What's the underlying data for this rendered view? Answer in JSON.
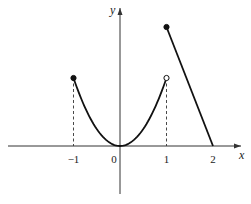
{
  "chart_data": {
    "type": "line",
    "title": "",
    "xlabel": "x",
    "ylabel": "y",
    "xlim": [
      -2.6,
      2.3
    ],
    "ylim": [
      -0.75,
      2.05
    ],
    "x_ticks": [
      {
        "value": -1,
        "label": "−1"
      },
      {
        "value": 0,
        "label": "0"
      },
      {
        "value": 1,
        "label": "1"
      },
      {
        "value": 2,
        "label": "2"
      }
    ],
    "grid": false,
    "series": [
      {
        "name": "parabola",
        "description": "y = x^2 on [-1, 1)",
        "x": [
          -1,
          -0.75,
          -0.5,
          -0.25,
          0,
          0.25,
          0.5,
          0.75,
          1
        ],
        "y": [
          1,
          0.5625,
          0.25,
          0.0625,
          0,
          0.0625,
          0.25,
          0.5625,
          1
        ]
      },
      {
        "name": "line",
        "description": "decreasing segment on [1, 2]",
        "x": [
          1,
          2
        ],
        "y": [
          1.75,
          0
        ]
      }
    ],
    "points": [
      {
        "x": -1,
        "y": 1,
        "style": "filled"
      },
      {
        "x": 1,
        "y": 1,
        "style": "open"
      },
      {
        "x": 1,
        "y": 1.75,
        "style": "filled"
      }
    ],
    "dashed_guides": [
      {
        "x": -1,
        "y": 1
      },
      {
        "x": 1,
        "y": 1
      }
    ]
  }
}
